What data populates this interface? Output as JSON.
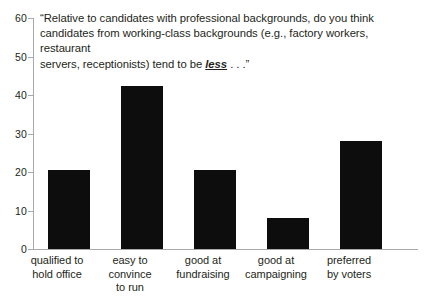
{
  "chart_data": {
    "type": "bar",
    "title": "“Relative to candidates with professional backgrounds, do you think candidates from working-class backgrounds (e.g., factory workers, restaurant servers, receptionists) tend to be less . . .”",
    "title_lines": [
      "“Relative to candidates with professional backgrounds, do you think",
      "candidates from working-class backgrounds (e.g., factory workers, restaurant",
      "servers, receptionists) tend to be "
    ],
    "title_emphasis": "less",
    "title_tail": " . . .”",
    "categories": [
      "qualified to hold office",
      "easy to convince to run",
      "good at fundraising",
      "good at campaigning",
      "preferred by voters"
    ],
    "category_lines": [
      [
        "qualified to",
        "hold office"
      ],
      [
        "easy to",
        "convince",
        "to run"
      ],
      [
        "good at",
        "fundraising"
      ],
      [
        "good at",
        "campaigning"
      ],
      [
        "preferred",
        "by voters"
      ]
    ],
    "values": [
      20.5,
      42.3,
      20.4,
      8.0,
      28.0
    ],
    "xlabel": "",
    "ylabel": "",
    "ylim": [
      0,
      60
    ],
    "yticks": [
      0,
      10,
      20,
      30,
      40,
      50,
      60
    ],
    "ytick_labels": [
      "0",
      "10",
      "20",
      "30",
      "40",
      "50",
      "60"
    ],
    "grid": false,
    "legend": false,
    "bar_color": "#0d0d0d",
    "axis_color": "#a7a9ac",
    "text_color": "#231f20",
    "background": "#ffffff"
  }
}
